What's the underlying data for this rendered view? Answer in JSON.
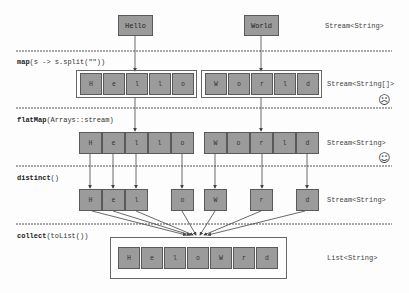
{
  "colors": {
    "cell_fill": "#9b9b9b",
    "cell_border": "#5a5a5a",
    "line": "#444444"
  },
  "source": {
    "words": [
      "Hello",
      "World"
    ],
    "type": "Stream<String>"
  },
  "map_step": {
    "op_name": "map",
    "op_args": "(s -> s.split(\"\"))",
    "groups": [
      [
        "H",
        "e",
        "l",
        "l",
        "o"
      ],
      [
        "W",
        "o",
        "r",
        "l",
        "d"
      ]
    ],
    "type": "Stream<String[]>",
    "face": "sad-face-icon"
  },
  "flatmap_step": {
    "op_name": "flatMap",
    "op_args": "(Arrays::stream)",
    "cells": [
      "H",
      "e",
      "l",
      "l",
      "o",
      "W",
      "o",
      "r",
      "l",
      "d"
    ],
    "type": "Stream<String>",
    "face": "smiley-face-icon"
  },
  "distinct_step": {
    "op_name": "distinct",
    "op_args": "()",
    "cells": [
      "H",
      "e",
      "l",
      "o",
      "W",
      "r",
      "d"
    ],
    "type": "Stream<String>"
  },
  "collect_step": {
    "op_name": "collect",
    "op_args": "(toList())",
    "cells": [
      "H",
      "e",
      "l",
      "o",
      "W",
      "r",
      "d"
    ],
    "type": "List<String>"
  }
}
